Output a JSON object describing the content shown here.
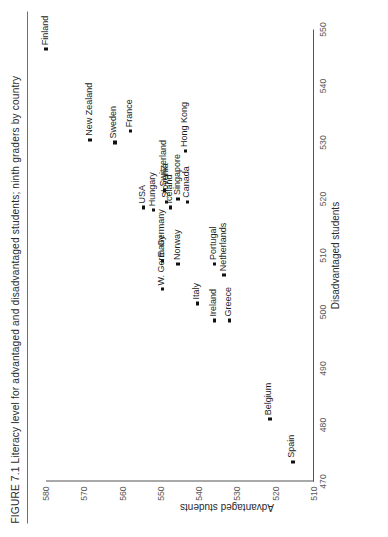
{
  "figure": {
    "number": "FIGURE 7.1",
    "caption": "Literacy level for advantaged and disadvantaged students; ninth graders by country",
    "full_title": "FIGURE 7.1  Literacy level for advantaged and disadvantaged students; ninth graders by country"
  },
  "chart_data": {
    "type": "scatter",
    "title": "Literacy level for advantaged and disadvantaged students; ninth graders by country",
    "xlabel": "Disadvantaged students",
    "ylabel": "Advantaged students",
    "xlim": [
      470,
      550
    ],
    "ylim": [
      510,
      580
    ],
    "xticks": [
      470,
      480,
      490,
      500,
      510,
      520,
      530,
      540,
      550
    ],
    "xtick_labels": [
      "470",
      "480",
      "490",
      "500",
      "510",
      "520",
      "530",
      "540",
      "550"
    ],
    "yticks": [
      510,
      520,
      530,
      540,
      550,
      560,
      570,
      580
    ],
    "ytick_labels": [
      "510",
      "520",
      "530",
      "540",
      "550",
      "560",
      "570",
      "580"
    ],
    "grid": false,
    "legend": null,
    "points": [
      {
        "label": "Finland",
        "x": 546.5,
        "y": 580.0,
        "label_pos": "right"
      },
      {
        "label": "New Zealand",
        "x": 530.5,
        "y": 568.5,
        "label_pos": "right"
      },
      {
        "label": "Sweden",
        "x": 530.0,
        "y": 562.0,
        "label_pos": "right"
      },
      {
        "label": "France",
        "x": 532.0,
        "y": 558.0,
        "label_pos": "right"
      },
      {
        "label": "USA",
        "x": 518.5,
        "y": 554.5,
        "label_pos": "right"
      },
      {
        "label": "Hungary",
        "x": 518.0,
        "y": 552.0,
        "label_pos": "right"
      },
      {
        "label": "Switzerland",
        "x": 521.5,
        "y": 549.0,
        "label_pos": "right"
      },
      {
        "label": "Hong Kong",
        "x": 528.5,
        "y": 543.5,
        "label_pos": "right"
      },
      {
        "label": "Slovenia",
        "x": 519.5,
        "y": 548.5,
        "label_pos": "right"
      },
      {
        "label": "Iceland",
        "x": 518.5,
        "y": 547.5,
        "label_pos": "right"
      },
      {
        "label": "Singapore",
        "x": 520.0,
        "y": 545.5,
        "label_pos": "right"
      },
      {
        "label": "Canada",
        "x": 519.5,
        "y": 543.0,
        "label_pos": "right"
      },
      {
        "label": "E. Germany",
        "x": 509.0,
        "y": 549.5,
        "label_pos": "right"
      },
      {
        "label": "W. Germany",
        "x": 504.0,
        "y": 549.5,
        "label_pos": "right"
      },
      {
        "label": "Norway",
        "x": 508.5,
        "y": 545.5,
        "label_pos": "right"
      },
      {
        "label": "Italy",
        "x": 501.5,
        "y": 540.5,
        "label_pos": "right"
      },
      {
        "label": "Portugal",
        "x": 508.5,
        "y": 536.0,
        "label_pos": "right"
      },
      {
        "label": "Netherlands",
        "x": 506.5,
        "y": 533.5,
        "label_pos": "right"
      },
      {
        "label": "Ireland",
        "x": 498.5,
        "y": 536.0,
        "label_pos": "right"
      },
      {
        "label": "Greece",
        "x": 498.5,
        "y": 532.0,
        "label_pos": "right"
      },
      {
        "label": "Belgium",
        "x": 481.0,
        "y": 521.5,
        "label_pos": "right"
      },
      {
        "label": "Spain",
        "x": 473.5,
        "y": 515.5,
        "label_pos": "right"
      }
    ]
  }
}
